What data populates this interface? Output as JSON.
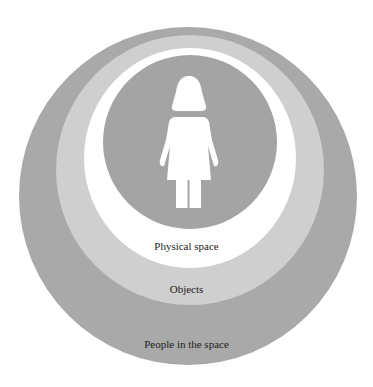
{
  "colors": {
    "background": "#ffffff",
    "outer_ring": "#a9a9a9",
    "objects_ring": "#cfcfcf",
    "physical_space_ring": "#ffffff",
    "inner_circle": "#a4a4a4",
    "figure": "#ffffff",
    "text": "#222222"
  },
  "diagram": {
    "rings": [
      {
        "name": "people-in-the-space",
        "label": "People in the space"
      },
      {
        "name": "objects",
        "label": "Objects"
      },
      {
        "name": "physical-space",
        "label": "Physical space"
      }
    ],
    "center_icon": "female-figure-icon"
  }
}
